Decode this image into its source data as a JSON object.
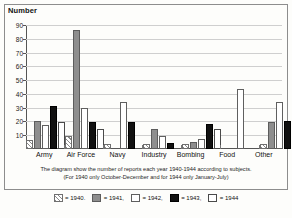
{
  "axis": {
    "ylabel": "Number"
  },
  "caption": {
    "line1": "The diagram show the number of reports each year 1940-1944 according to subjects.",
    "line2": "(For 1940 only October-December and for 1944 only January-July)"
  },
  "legend": {
    "items": [
      {
        "label": "= 1940.",
        "year": "1940",
        "pattern": "hatched",
        "color": "#8a8a8a"
      },
      {
        "label": "= 1941,",
        "year": "1941",
        "pattern": "solid-gray",
        "color": "#8e8e8e"
      },
      {
        "label": "= 1942,",
        "year": "1942",
        "pattern": "dotted",
        "color": "#6e6e6e"
      },
      {
        "label": "= 1943,",
        "year": "1943",
        "pattern": "solid-black",
        "color": "#111111"
      },
      {
        "label": "= 1944",
        "year": "1944",
        "pattern": "white",
        "color": "#ffffff"
      }
    ]
  },
  "chart_data": {
    "type": "bar",
    "title": "",
    "xlabel": "",
    "ylabel": "Number",
    "ylim": [
      0,
      90
    ],
    "yticks": [
      90,
      80,
      70,
      60,
      50,
      40,
      30,
      20,
      10
    ],
    "grid": true,
    "legend_position": "bottom",
    "categories": [
      "Army",
      "Air Force",
      "Navy",
      "Industry",
      "Bombing",
      "Food",
      "Other"
    ],
    "series": [
      {
        "name": "1940",
        "values": [
          5,
          8,
          2,
          2,
          2,
          0,
          2
        ]
      },
      {
        "name": "1941",
        "values": [
          19,
          85,
          0,
          13,
          4,
          0,
          18
        ]
      },
      {
        "name": "1942",
        "values": [
          16,
          28,
          33,
          8,
          6,
          42,
          33
        ]
      },
      {
        "name": "1943",
        "values": [
          30,
          18,
          18,
          3,
          17,
          0,
          19
        ]
      },
      {
        "name": "1944",
        "values": [
          18,
          13,
          0,
          0,
          13,
          0,
          16
        ]
      }
    ]
  }
}
